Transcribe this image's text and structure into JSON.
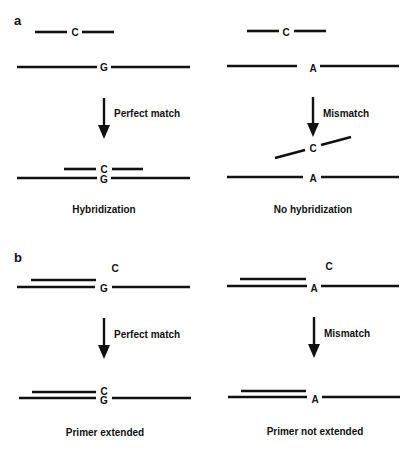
{
  "figure": {
    "colors": {
      "ink": "#111111",
      "background": "#ffffff"
    },
    "panels": [
      {
        "label": "a",
        "columns": [
          {
            "top": {
              "probe_base": "C",
              "target_base": "G"
            },
            "step_label": "Perfect match",
            "bottom": {
              "probe_base": "C",
              "target_base": "G"
            },
            "caption": "Hybridization"
          },
          {
            "top": {
              "probe_base": "C",
              "target_base": "A"
            },
            "step_label": "Mismatch",
            "bottom": {
              "probe_base": "C",
              "target_base": "A"
            },
            "caption": "No hybridization"
          }
        ]
      },
      {
        "label": "b",
        "columns": [
          {
            "top": {
              "free_base": "C",
              "target_base": "G"
            },
            "step_label": "Perfect match",
            "bottom": {
              "incorporated_base": "C",
              "target_base": "G"
            },
            "caption": "Primer extended"
          },
          {
            "top": {
              "free_base": "C",
              "target_base": "A"
            },
            "step_label": "Mismatch",
            "bottom": {
              "target_base": "A"
            },
            "caption": "Primer not extended"
          }
        ]
      }
    ]
  }
}
